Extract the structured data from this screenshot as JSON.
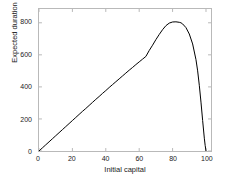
{
  "chart_data": {
    "type": "line",
    "title": "",
    "xlabel": "Initial capital",
    "ylabel": "Expected duration",
    "xlim": [
      0,
      103
    ],
    "ylim": [
      0,
      886
    ],
    "xticks": [
      0,
      20,
      40,
      60,
      80,
      100
    ],
    "yticks": [
      0,
      200,
      400,
      600,
      800
    ],
    "xtick_labels": [
      "0",
      "20",
      "40",
      "60",
      "80",
      "100"
    ],
    "ytick_labels": [
      "0",
      "200",
      "400",
      "600",
      "800"
    ],
    "grid": false,
    "legend": null,
    "line_color": "#000000",
    "axis_color": "#b9b9b9",
    "background_color": "#ffffff",
    "series": [
      {
        "name": "Expected duration",
        "x": [
          0,
          2,
          4,
          6,
          8,
          10,
          12,
          14,
          16,
          18,
          20,
          22,
          24,
          26,
          28,
          30,
          32,
          34,
          36,
          38,
          40,
          42,
          44,
          46,
          48,
          50,
          52,
          54,
          56,
          58,
          60,
          62,
          64,
          66,
          68,
          70,
          72,
          74,
          76,
          78,
          80,
          82,
          84,
          85,
          86,
          88,
          90,
          92,
          94,
          95,
          96,
          97,
          98,
          99,
          99.5,
          100
        ],
        "y": [
          0,
          19,
          38,
          57,
          76,
          95,
          114,
          133,
          152,
          171,
          190,
          209,
          228,
          247,
          265,
          284,
          303,
          322,
          340,
          359,
          377,
          396,
          414,
          432,
          450,
          468,
          486,
          504,
          521,
          539,
          556,
          573,
          590,
          627,
          660,
          695,
          727,
          757,
          782,
          798,
          805,
          806,
          803,
          800,
          793,
          770,
          730,
          668,
          570,
          500,
          410,
          305,
          190,
          80,
          35,
          0
        ]
      }
    ],
    "annotations": {
      "peak_x": 85,
      "peak_y": 806
    }
  }
}
